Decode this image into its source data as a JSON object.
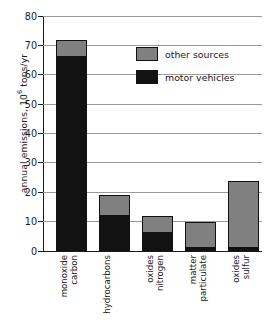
{
  "chart_data": {
    "type": "bar",
    "title": "",
    "subtitle": "",
    "xlabel": "",
    "ylabel": "annual emissions, 10⁶ tons/yr",
    "ylabel_prefix": "annual emissions, 10",
    "ylabel_exponent": "6",
    "ylabel_suffix": " tons/yr",
    "stacked": true,
    "grid": true,
    "grid_axis": "y",
    "legend_position": "upper-right-inside",
    "ylim": [
      0,
      80
    ],
    "ytick_step": 10,
    "ytick_labels": [
      "0",
      "10",
      "20",
      "30",
      "40",
      "50",
      "60",
      "70",
      "80"
    ],
    "ytick_values": [
      0,
      10,
      20,
      30,
      40,
      50,
      60,
      70,
      80
    ],
    "categories": [
      "carbon monoxide",
      "hydrocarbons",
      "nitrogen oxides",
      "particulate matter",
      "sulfur oxides"
    ],
    "category_lines": [
      [
        "carbon",
        "monoxide"
      ],
      [
        "hydrocarbons"
      ],
      [
        "nitrogen",
        "oxides"
      ],
      [
        "particulate",
        "matter"
      ],
      [
        "sulfur",
        "oxides"
      ]
    ],
    "series": [
      {
        "name": "motor vehicles",
        "color": "#121212",
        "values": [
          66,
          12,
          6,
          1,
          1
        ]
      },
      {
        "name": "other sources",
        "color": "#808080",
        "values": [
          6,
          7,
          6,
          9,
          23
        ]
      }
    ],
    "totals": [
      72,
      19,
      12,
      10,
      24
    ]
  },
  "legend": {
    "items": [
      {
        "label": "other sources",
        "color": "#808080",
        "swatch": "other"
      },
      {
        "label": "motor vehicles",
        "color": "#121212",
        "swatch": "motor"
      }
    ]
  },
  "colors": {
    "other_sources": "#808080",
    "motor_vehicles": "#121212",
    "gridline": "#9a9a9a",
    "axis": "#1a1a1a",
    "background": "#ffffff"
  }
}
